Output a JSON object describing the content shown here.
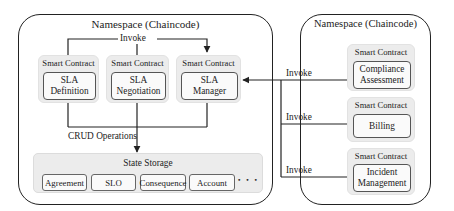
{
  "left_namespace": {
    "title": "Namespace (Chaincode)",
    "invoke_label": "Invoke",
    "contracts": [
      {
        "header": "Smart Contract",
        "line1": "SLA",
        "line2": "Definition"
      },
      {
        "header": "Smart Contract",
        "line1": "SLA",
        "line2": "Negotiation"
      },
      {
        "header": "Smart Contract",
        "line1": "SLA",
        "line2": "Manager"
      }
    ],
    "crud_label": "CRUD Operations",
    "state_storage": {
      "title": "State Storage",
      "items": [
        "Agreement",
        "SLO",
        "Consequence",
        "Account"
      ],
      "more": "• • •"
    }
  },
  "right_namespace": {
    "title": "Namespace (Chaincode)",
    "contracts": [
      {
        "header": "Smart Contract",
        "line1": "Compliance",
        "line2": "Assessment"
      },
      {
        "header": "Smart Contract",
        "line1": "Billing",
        "line2": ""
      },
      {
        "header": "Smart Contract",
        "line1": "Incident",
        "line2": "Management"
      }
    ]
  },
  "connectors": {
    "invoke_labels": [
      "Invoke",
      "Invoke",
      "Invoke"
    ]
  },
  "colors": {
    "line": "#222222",
    "group_bg": "#ececec",
    "box_bg": "#fafafa"
  }
}
